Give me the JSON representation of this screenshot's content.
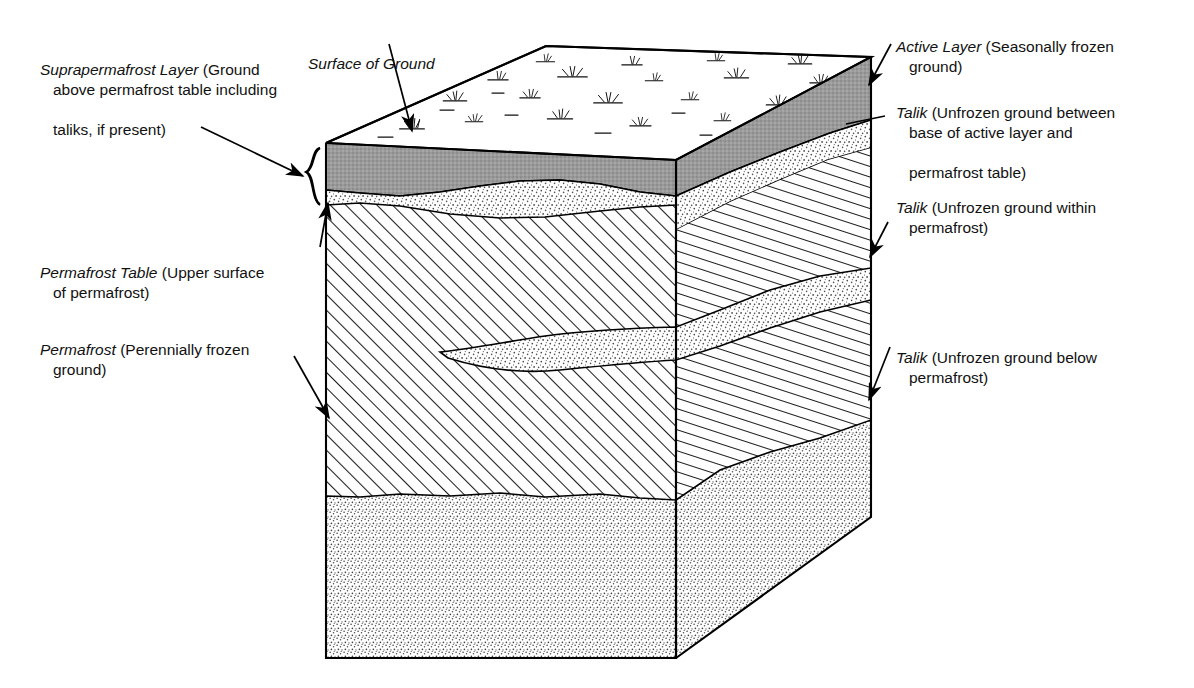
{
  "figure": {
    "kind": "block-diagram",
    "background_color": "#ffffff",
    "ink_color": "#000000"
  },
  "labels": {
    "surface_of_ground": {
      "term": "Surface of Ground",
      "definition": "",
      "line1": "Surface of Ground",
      "line2": ""
    },
    "suprapermafrost_layer": {
      "term": "Suprapermafrost Layer",
      "definition": "(Ground",
      "line2": "above permafrost table including",
      "line3": "taliks, if present)"
    },
    "permafrost_table": {
      "term": "Permafrost Table",
      "definition": "(Upper surface",
      "line2": "of permafrost)"
    },
    "permafrost": {
      "term": "Permafrost",
      "definition": "(Perennially frozen",
      "line2": "ground)"
    },
    "active_layer": {
      "term": "Active Layer",
      "definition": "(Seasonally frozen",
      "line2": "ground)"
    },
    "talik_between": {
      "term": "Talik",
      "definition": "(Unfrozen ground between",
      "line2": "base of active layer and",
      "line3": "permafrost table)"
    },
    "talik_within": {
      "term": "Talik",
      "definition": "(Unfrozen ground within",
      "line2": "permafrost)"
    },
    "talik_below": {
      "term": "Talik",
      "definition": "(Unfrozen ground below",
      "line2": "permafrost)"
    }
  },
  "layers": [
    {
      "name": "active-layer",
      "fill": "#999999",
      "pattern": "solid-gray",
      "position": "uppermost, beneath ground surface"
    },
    {
      "name": "talik-suprapermafrost",
      "fill": "#ffffff",
      "pattern": "stipple",
      "position": "between base of active layer and permafrost table"
    },
    {
      "name": "permafrost",
      "fill": "#ffffff",
      "pattern": "diagonal-hatch",
      "position": "main body of block"
    },
    {
      "name": "talik-within-permafrost",
      "fill": "#ffffff",
      "pattern": "stipple",
      "position": "lens within permafrost"
    },
    {
      "name": "talik-below-permafrost",
      "fill": "#ffffff",
      "pattern": "stipple",
      "position": "lowermost, beneath permafrost base"
    }
  ],
  "colors": {
    "active_layer_gray": "#999999",
    "stipple_dot": "#555555",
    "hatch_line": "#222222",
    "outline": "#000000"
  },
  "block_geometry": {
    "top_front_left": [
      326,
      143
    ],
    "top_back_left": [
      546,
      46
    ],
    "top_back_right": [
      871,
      57
    ],
    "top_front_right": [
      676,
      160
    ],
    "bottom_front_left": [
      326,
      658
    ],
    "bottom_front_right": [
      676,
      658
    ],
    "bottom_back_right": [
      871,
      517
    ]
  }
}
